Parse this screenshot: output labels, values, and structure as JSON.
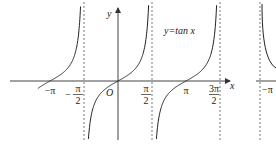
{
  "chart_data": {
    "type": "line",
    "title": "y=tan x",
    "function": "tan",
    "xlabel": "x",
    "ylabel": "y",
    "origin_label": "O",
    "xlim": [
      -3.7,
      5.0
    ],
    "ylim": [
      -5,
      5
    ],
    "asymptotes": [
      -1.5708,
      1.5708,
      4.7124
    ],
    "asymptote_labels": [
      {
        "num": "π",
        "den": "2",
        "sign": "−"
      },
      {
        "num": "π",
        "den": "2",
        "sign": ""
      },
      {
        "num": "3π",
        "den": "2",
        "sign": ""
      }
    ],
    "zero_labels": [
      "−π",
      "π"
    ],
    "zeros": [
      -3.1416,
      3.1416
    ],
    "branches": [
      {
        "from": -3.7,
        "to": -1.5708
      },
      {
        "from": -1.5708,
        "to": 1.5708
      },
      {
        "from": 1.5708,
        "to": 4.7124
      }
    ],
    "second_panel": {
      "asymptote_label": "",
      "zero_label": "−π"
    },
    "grid": false,
    "colors": {
      "curve": "#222222",
      "axis": "#444444",
      "asymptote": "#555555"
    }
  }
}
